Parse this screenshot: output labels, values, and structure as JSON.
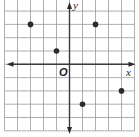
{
  "chart_data": {
    "type": "scatter",
    "title": "",
    "xlabel": "x",
    "ylabel": "y",
    "origin_label": "O",
    "xlim": [
      -5,
      5
    ],
    "ylim": [
      -5,
      5
    ],
    "grid": true,
    "tick_labels": false,
    "points": [
      {
        "x": -3,
        "y": 3
      },
      {
        "x": 2,
        "y": 3
      },
      {
        "x": -1,
        "y": 1
      },
      {
        "x": 1,
        "y": -3
      },
      {
        "x": 4,
        "y": -2
      }
    ],
    "colors": {
      "point": "#2b2b2b",
      "axis": "#3a3a3a",
      "grid": "#9a9a9a"
    }
  }
}
